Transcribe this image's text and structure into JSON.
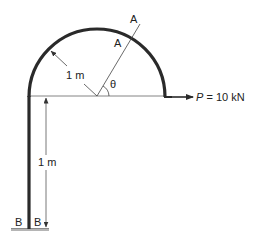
{
  "figure": {
    "colors": {
      "member": "#2a2a2a",
      "thin_line": "#555555",
      "ground": "#9a9a9a",
      "text": "#222222"
    }
  },
  "labels": {
    "radius": "1 m",
    "height": "1 m",
    "section_outer": "A",
    "section_inner": "A",
    "angle": "θ",
    "load_symbol": "P",
    "load_value": " = 10 kN",
    "support_left": "B",
    "support_right": "B"
  },
  "geometry": {
    "arc_radius_m": 1,
    "column_height_m": 1,
    "load_kN": 10
  }
}
